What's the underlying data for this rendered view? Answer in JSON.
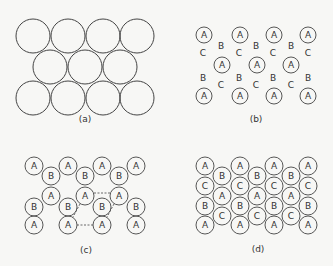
{
  "figure": {
    "panels": [
      {
        "id": "a",
        "label": "(a)",
        "label_pos": [
          85,
          120
        ],
        "description": "Close-packed layer of identical spheres",
        "circle_radius": 17,
        "circles": [
          {
            "x": 33,
            "y": 36,
            "t": ""
          },
          {
            "x": 68,
            "y": 36,
            "t": ""
          },
          {
            "x": 103,
            "y": 36,
            "t": ""
          },
          {
            "x": 137,
            "y": 36,
            "t": ""
          },
          {
            "x": 50,
            "y": 67,
            "t": ""
          },
          {
            "x": 85,
            "y": 67,
            "t": ""
          },
          {
            "x": 120,
            "y": 67,
            "t": ""
          },
          {
            "x": 33,
            "y": 98,
            "t": ""
          },
          {
            "x": 68,
            "y": 98,
            "t": ""
          },
          {
            "x": 103,
            "y": 98,
            "t": ""
          },
          {
            "x": 137,
            "y": 98,
            "t": ""
          }
        ],
        "letters": []
      },
      {
        "id": "b",
        "label": "(b)",
        "label_pos": [
          256,
          120
        ],
        "description": "Layer A with B and C hollow positions",
        "circle_radius": 8,
        "circles": [
          {
            "x": 204,
            "y": 35,
            "t": "A"
          },
          {
            "x": 240,
            "y": 35,
            "t": "A"
          },
          {
            "x": 274,
            "y": 35,
            "t": "A"
          },
          {
            "x": 308,
            "y": 35,
            "t": "A"
          },
          {
            "x": 222,
            "y": 65,
            "t": "A"
          },
          {
            "x": 257,
            "y": 65,
            "t": "A"
          },
          {
            "x": 291,
            "y": 65,
            "t": "A"
          },
          {
            "x": 204,
            "y": 96,
            "t": "A"
          },
          {
            "x": 240,
            "y": 96,
            "t": "A"
          },
          {
            "x": 274,
            "y": 96,
            "t": "A"
          },
          {
            "x": 308,
            "y": 96,
            "t": "A"
          }
        ],
        "letters": [
          {
            "x": 221,
            "y": 46,
            "t": "B"
          },
          {
            "x": 256,
            "y": 46,
            "t": "B"
          },
          {
            "x": 291,
            "y": 46,
            "t": "B"
          },
          {
            "x": 203,
            "y": 53,
            "t": "C"
          },
          {
            "x": 239,
            "y": 53,
            "t": "C"
          },
          {
            "x": 273,
            "y": 53,
            "t": "C"
          },
          {
            "x": 308,
            "y": 53,
            "t": "C"
          },
          {
            "x": 203,
            "y": 78,
            "t": "B"
          },
          {
            "x": 239,
            "y": 78,
            "t": "B"
          },
          {
            "x": 273,
            "y": 78,
            "t": "B"
          },
          {
            "x": 308,
            "y": 78,
            "t": "B"
          },
          {
            "x": 221,
            "y": 85,
            "t": "C"
          },
          {
            "x": 256,
            "y": 85,
            "t": "C"
          },
          {
            "x": 291,
            "y": 85,
            "t": "C"
          }
        ]
      },
      {
        "id": "c",
        "label": "(c)",
        "label_pos": [
          86,
          251
        ],
        "description": "Two-layer AB stacking with dashed unit cell outline",
        "circle_radius": 9,
        "circles": [
          {
            "x": 34,
            "y": 166,
            "t": "A"
          },
          {
            "x": 68,
            "y": 166,
            "t": "A"
          },
          {
            "x": 102,
            "y": 166,
            "t": "A"
          },
          {
            "x": 136,
            "y": 166,
            "t": "A"
          },
          {
            "x": 51,
            "y": 176,
            "t": "B"
          },
          {
            "x": 85,
            "y": 176,
            "t": "B"
          },
          {
            "x": 119,
            "y": 176,
            "t": "B"
          },
          {
            "x": 51,
            "y": 196,
            "t": "A"
          },
          {
            "x": 85,
            "y": 196,
            "t": "A"
          },
          {
            "x": 119,
            "y": 196,
            "t": "A"
          },
          {
            "x": 34,
            "y": 207,
            "t": "B"
          },
          {
            "x": 68,
            "y": 207,
            "t": "B"
          },
          {
            "x": 102,
            "y": 207,
            "t": "B"
          },
          {
            "x": 136,
            "y": 207,
            "t": "B"
          },
          {
            "x": 34,
            "y": 225,
            "t": "A"
          },
          {
            "x": 68,
            "y": 225,
            "t": "A"
          },
          {
            "x": 102,
            "y": 225,
            "t": "A"
          },
          {
            "x": 136,
            "y": 225,
            "t": "A"
          }
        ],
        "letters": [],
        "dashed_lines": [
          {
            "x1": 94,
            "y1": 193,
            "x2": 110,
            "y2": 193
          },
          {
            "x1": 77,
            "y1": 225,
            "x2": 93,
            "y2": 225
          },
          {
            "x1": 80,
            "y1": 204,
            "x2": 73,
            "y2": 217
          },
          {
            "x1": 114,
            "y1": 204,
            "x2": 107,
            "y2": 217
          }
        ]
      },
      {
        "id": "d",
        "label": "(d)",
        "label_pos": [
          258,
          250
        ],
        "description": "Three-layer ABC close-packed stacking",
        "circle_radius": 9,
        "circles": [
          {
            "x": 205,
            "y": 166,
            "t": "A"
          },
          {
            "x": 205,
            "y": 186,
            "t": "C"
          },
          {
            "x": 205,
            "y": 206,
            "t": "B"
          },
          {
            "x": 205,
            "y": 225,
            "t": "A"
          },
          {
            "x": 222,
            "y": 176,
            "t": "B"
          },
          {
            "x": 222,
            "y": 196,
            "t": "A"
          },
          {
            "x": 222,
            "y": 216,
            "t": "C"
          },
          {
            "x": 240,
            "y": 166,
            "t": "A"
          },
          {
            "x": 240,
            "y": 186,
            "t": "C"
          },
          {
            "x": 240,
            "y": 206,
            "t": "B"
          },
          {
            "x": 240,
            "y": 225,
            "t": "A"
          },
          {
            "x": 257,
            "y": 176,
            "t": "B"
          },
          {
            "x": 257,
            "y": 196,
            "t": "A"
          },
          {
            "x": 257,
            "y": 216,
            "t": "C"
          },
          {
            "x": 274,
            "y": 166,
            "t": "A"
          },
          {
            "x": 274,
            "y": 186,
            "t": "C"
          },
          {
            "x": 274,
            "y": 206,
            "t": "B"
          },
          {
            "x": 274,
            "y": 225,
            "t": "A"
          },
          {
            "x": 291,
            "y": 176,
            "t": "B"
          },
          {
            "x": 291,
            "y": 196,
            "t": "A"
          },
          {
            "x": 291,
            "y": 216,
            "t": "C"
          },
          {
            "x": 308,
            "y": 166,
            "t": "A"
          },
          {
            "x": 308,
            "y": 186,
            "t": "C"
          },
          {
            "x": 308,
            "y": 206,
            "t": "B"
          },
          {
            "x": 308,
            "y": 225,
            "t": "A"
          }
        ],
        "letters": []
      }
    ],
    "colors": {
      "background": "#f7f7f5",
      "stroke": "#444444",
      "text": "#333333"
    }
  }
}
